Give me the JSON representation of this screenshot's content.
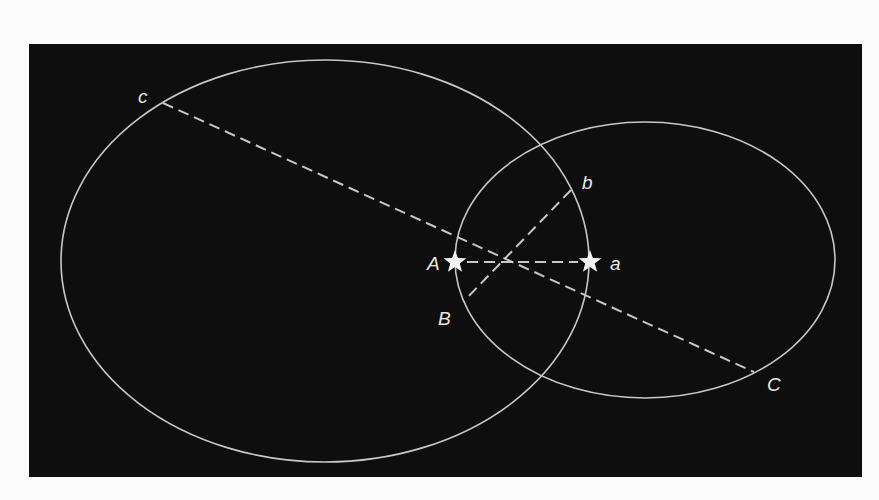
{
  "diagram": {
    "background_color": "#0e0e0e",
    "line_color": "#c8c8c8",
    "ellipses": [
      {
        "id": "large-orbit",
        "cx": 325,
        "cy": 261,
        "rx": 264,
        "ry": 201
      },
      {
        "id": "small-orbit",
        "cx": 645,
        "cy": 260,
        "rx": 190,
        "ry": 138
      }
    ],
    "stars": [
      {
        "id": "star-A",
        "label": "A",
        "x": 455,
        "y": 262
      },
      {
        "id": "star-a",
        "label": "a",
        "x": 590,
        "y": 262
      }
    ],
    "dashed_lines": [
      {
        "id": "line-A-a",
        "from": [
          467,
          262
        ],
        "to": [
          578,
          262
        ]
      },
      {
        "id": "line-c-C",
        "from": [
          163,
          103
        ],
        "to": [
          754,
          372
        ]
      },
      {
        "id": "line-b-B",
        "from": [
          571,
          190
        ],
        "to": [
          465,
          300
        ]
      }
    ],
    "labels": {
      "A": "A",
      "a": "a",
      "b": "b",
      "B": "B",
      "c": "c",
      "C": "C"
    },
    "label_positions": {
      "A": [
        427,
        270
      ],
      "a": [
        610,
        270
      ],
      "b": [
        582,
        189
      ],
      "B": [
        438,
        325
      ],
      "c": [
        138,
        103
      ],
      "C": [
        767,
        391
      ]
    }
  }
}
